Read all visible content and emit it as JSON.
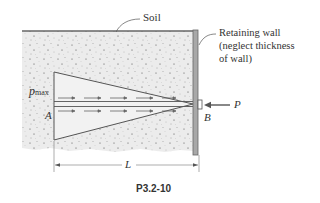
{
  "figure": {
    "caption": "P3.2-10",
    "labels": {
      "soil": "Soil",
      "wall_line1": "Retaining wall",
      "wall_line2": "(neglect thickness",
      "wall_line3": "of wall)",
      "p_max_base": "p",
      "p_max_sub": "max",
      "point_a": "A",
      "point_b": "B",
      "load": "P",
      "length": "L"
    },
    "colors": {
      "soil_fill": "#ececec",
      "triangle_fill": "#f2f2f2",
      "line": "#555555",
      "wall": "#a8a8a8",
      "text": "#333333"
    }
  }
}
